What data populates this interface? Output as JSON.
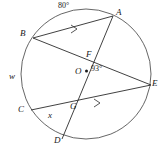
{
  "figure": {
    "type": "circle-geometry-diagram",
    "stroke_color": "#2b2b2b",
    "background_color": "#ffffff",
    "circle": {
      "cx": 86,
      "cy": 74,
      "r": 65,
      "label": "w"
    },
    "center_point": {
      "label": "O",
      "x": 86,
      "y": 71
    },
    "points": [
      {
        "name": "A",
        "label": "A",
        "x": 113,
        "y": 16,
        "label_x": 116,
        "label_y": 8
      },
      {
        "name": "B",
        "label": "B",
        "x": 33,
        "y": 38,
        "label_x": 21,
        "label_y": 28
      },
      {
        "name": "C",
        "label": "C",
        "x": 31,
        "y": 110,
        "label_x": 19,
        "label_y": 106
      },
      {
        "name": "D",
        "label": "D",
        "x": 62,
        "y": 139,
        "label_x": 55,
        "label_y": 138
      },
      {
        "name": "E",
        "label": "E",
        "x": 151,
        "y": 85,
        "label_x": 152,
        "label_y": 80
      },
      {
        "name": "F",
        "label": "F",
        "x": 90,
        "y": 61,
        "label_x": 86,
        "label_y": 50
      },
      {
        "name": "G",
        "label": "G",
        "x": 68,
        "y": 109,
        "label_x": 69,
        "label_y": 102
      }
    ],
    "chords": [
      {
        "name": "chord-BA",
        "from": "B",
        "to": "A",
        "tick": true
      },
      {
        "name": "chord-BE",
        "from": "B",
        "to": "E",
        "tick": false
      },
      {
        "name": "chord-AD",
        "from": "A",
        "to": "D",
        "tick": false
      },
      {
        "name": "chord-CE",
        "from": "C",
        "to": "E",
        "tick": true
      }
    ],
    "labels": {
      "arc_measure": "80°",
      "center_angle": "93°",
      "circle_name": "w",
      "unknown_angle": "x",
      "point_a": "A",
      "point_b": "B",
      "point_c": "C",
      "point_d": "D",
      "point_e": "E",
      "point_f": "F",
      "point_g": "G",
      "point_o": "O"
    },
    "label_positions": {
      "arc_measure": {
        "x": 58,
        "y": 3
      },
      "center_angle": {
        "x": 91,
        "y": 66
      },
      "circle_name": {
        "x": 10,
        "y": 73
      },
      "unknown_angle": {
        "x": 48,
        "y": 112
      }
    }
  }
}
